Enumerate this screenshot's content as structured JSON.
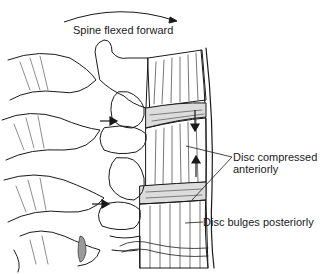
{
  "figure": {
    "type": "anatomical line illustration",
    "motion_arrow": "curved arrow pointing right (forward flexion)",
    "title": "Spine flexed forward",
    "labels": [
      {
        "id": "disc-compressed",
        "line1": "Disc compressed",
        "line2": "anteriorly"
      },
      {
        "id": "disc-bulges",
        "text": "Disc bulges posteriorly"
      }
    ],
    "colors": {
      "ink": "#1a1a1a",
      "background": "#ffffff",
      "shade": "#9a9a9a"
    }
  }
}
